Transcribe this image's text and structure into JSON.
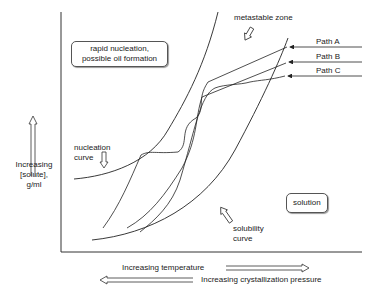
{
  "diagram": {
    "regions": {
      "rapid_nucleation": "rapid nucleation,\npossible oil formation",
      "rapid_nucleation_line1": "rapid nucleation,",
      "rapid_nucleation_line2": "possible oil formation",
      "solution": "solution",
      "metastable_zone": "metastable zone"
    },
    "curves": {
      "nucleation_line1": "nucleation",
      "nucleation_line2": "curve",
      "solubility_line1": "solubility",
      "solubility_line2": "curve"
    },
    "paths": [
      {
        "label": "Path A"
      },
      {
        "label": "Path B"
      },
      {
        "label": "Path C"
      }
    ],
    "y_axis": {
      "line1": "Increasing",
      "line2": "[solute],",
      "line3": "g/ml"
    },
    "x_axis": {
      "temperature": "Increasing temperature",
      "pressure": "Increasing crystallization pressure"
    },
    "colors": {
      "line": "#222222",
      "background": "#ffffff"
    }
  }
}
